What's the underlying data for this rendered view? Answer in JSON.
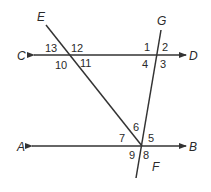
{
  "diagram": {
    "colors": {
      "line": "#333333",
      "text": "#2a2a2a",
      "background": "#ffffff"
    },
    "points": {
      "E": "E",
      "G": "G",
      "C": "C",
      "D": "D",
      "A": "A",
      "B": "B",
      "F": "F"
    },
    "angles": {
      "a1": "1",
      "a2": "2",
      "a3": "3",
      "a4": "4",
      "a5": "5",
      "a6": "6",
      "a7": "7",
      "a8": "8",
      "a9": "9",
      "a10": "10",
      "a11": "11",
      "a12": "12",
      "a13": "13"
    },
    "lines": [
      {
        "name": "CD",
        "type": "line with arrows both ends"
      },
      {
        "name": "AB",
        "type": "line with arrows both ends"
      },
      {
        "name": "E-transversal",
        "type": "segment from E to intersection on AB"
      },
      {
        "name": "GF",
        "type": "segment from G through to F"
      }
    ]
  }
}
